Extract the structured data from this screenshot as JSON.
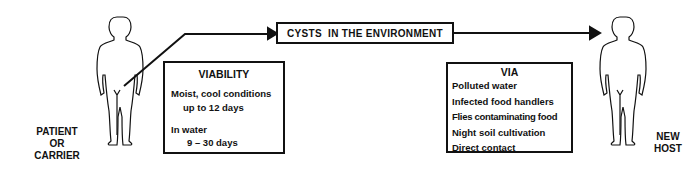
{
  "diagram": {
    "source": {
      "label_lines": [
        "PATIENT",
        "OR",
        "CARRIER"
      ]
    },
    "environment_box": {
      "label": "CYSTS  IN THE ENVIRONMENT"
    },
    "viability_box": {
      "title": "VIABILITY",
      "lines": [
        "Moist, cool conditions",
        "up to 12 days",
        "In water",
        "9 – 30 days"
      ]
    },
    "via_box": {
      "title": "VIA",
      "items": [
        "Polluted  water",
        "Infected  food handlers",
        "Flies contaminating food",
        "Night soil cultivation",
        "Direct  contact"
      ]
    },
    "target": {
      "label_lines": [
        "NEW",
        "HOST"
      ]
    },
    "icons": [
      "human-figure-icon",
      "arrow-right-icon"
    ],
    "colors": {
      "ink": "#111111",
      "background": "#ffffff"
    }
  }
}
